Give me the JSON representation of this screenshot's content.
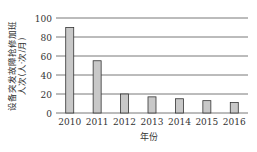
{
  "chart_data": {
    "type": "bar",
    "title": "",
    "categories": [
      "2010",
      "2011",
      "2012",
      "2013",
      "2014",
      "2015",
      "2016"
    ],
    "values": [
      90,
      55,
      20,
      17,
      15,
      13,
      11
    ],
    "xlabel": "年份",
    "ylabel": "设备突发故障抢修加班人次(人·次/月)",
    "ylabel_line1": "设备突发故障抢修加班",
    "ylabel_line2": "人次(人·次/月)",
    "ylim": [
      0,
      100
    ],
    "yticks": [
      0,
      20,
      40,
      60,
      80,
      100
    ],
    "grid": true,
    "bar_color": "#c8c8c8",
    "bar_edge_color": "#333333",
    "legend": null
  }
}
